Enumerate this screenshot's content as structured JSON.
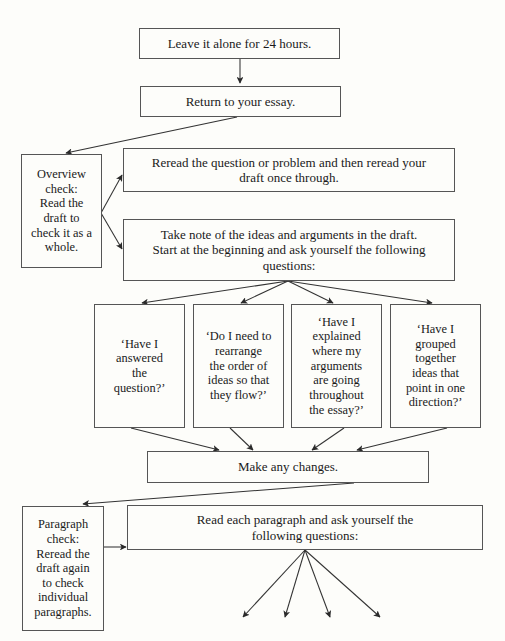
{
  "diagram": {
    "style": {
      "box_border": "#555555",
      "edge_color": "#333333",
      "background": "#fdfdfa",
      "text": "#1a1a1a"
    },
    "nodes": {
      "leave_alone": {
        "label": "Leave it alone for 24 hours."
      },
      "return_essay": {
        "label": "Return to your essay."
      },
      "overview_check": {
        "label": "Overview\ncheck:\nRead the\ndraft to\ncheck it as a\nwhole."
      },
      "reread": {
        "label": "Reread the question or problem and then reread your\ndraft once through."
      },
      "take_note": {
        "label": "Take note of the ideas and arguments in the draft.\nStart at the beginning and ask yourself the following\nquestions:"
      },
      "question_1": {
        "label": "‘Have I\nanswered\nthe\nquestion?’"
      },
      "question_2": {
        "label": "‘Do I need to\nrearrange\nthe order of\nideas so that\nthey flow?’"
      },
      "question_3": {
        "label": "‘Have I\nexplained\nwhere my\narguments\nare going\nthroughout\nthe essay?’"
      },
      "question_4": {
        "label": "‘Have I\ngrouped\ntogether\nideas that\npoint in one\ndirection?’"
      },
      "make_changes": {
        "label": "Make any changes."
      },
      "paragraph_check": {
        "label": "Paragraph\ncheck:\nReread the\ndraft again\nto check\nindividual\nparagraphs."
      },
      "read_each_para": {
        "label": "Read each paragraph and ask yourself the\nfollowing questions:"
      }
    },
    "edges": [
      {
        "from": "leave_alone",
        "to": "return_essay"
      },
      {
        "from": "return_essay",
        "to": "overview_check"
      },
      {
        "from": "overview_check",
        "to": "reread"
      },
      {
        "from": "overview_check",
        "to": "take_note"
      },
      {
        "from": "take_note",
        "to": "question_1"
      },
      {
        "from": "take_note",
        "to": "question_2"
      },
      {
        "from": "take_note",
        "to": "question_3"
      },
      {
        "from": "take_note",
        "to": "question_4"
      },
      {
        "from": "question_1",
        "to": "make_changes"
      },
      {
        "from": "question_2",
        "to": "make_changes"
      },
      {
        "from": "question_3",
        "to": "make_changes"
      },
      {
        "from": "question_4",
        "to": "make_changes"
      },
      {
        "from": "make_changes",
        "to": "paragraph_check"
      },
      {
        "from": "paragraph_check",
        "to": "read_each_para"
      },
      {
        "from": "read_each_para",
        "to": "offpage_1"
      },
      {
        "from": "read_each_para",
        "to": "offpage_2"
      },
      {
        "from": "read_each_para",
        "to": "offpage_3"
      },
      {
        "from": "read_each_para",
        "to": "offpage_4"
      }
    ]
  }
}
